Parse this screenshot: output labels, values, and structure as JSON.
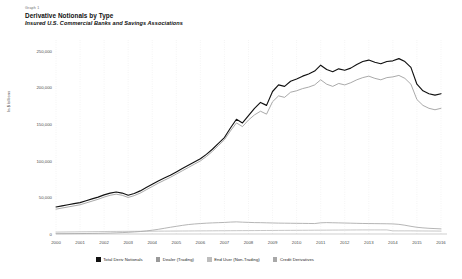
{
  "header": {
    "graph_number": "Graph 1",
    "title": "Derivative Notionals by Type",
    "subtitle": "Insured U.S. Commercial Banks and Savings Associations"
  },
  "legend": [
    {
      "label": "Total Deriv Notionals",
      "color": "#111111"
    },
    {
      "label": "Dealer (Trading)",
      "color": "#9a9a9a"
    },
    {
      "label": "End User (Non-Trading)",
      "color": "#bdbdbd"
    },
    {
      "label": "Credit Derivatives",
      "color": "#a8a8a8"
    }
  ],
  "chart_data": {
    "type": "line",
    "title": "Derivative Notionals by Type",
    "subtitle": "Insured U.S. Commercial Banks and Savings Associations",
    "xlabel": "",
    "ylabel": "In $ billions",
    "ylim": [
      0,
      260000
    ],
    "yticks": [
      0,
      50000,
      100000,
      150000,
      200000,
      250000
    ],
    "ytick_labels": [
      "0",
      "50,000",
      "100,000",
      "150,000",
      "200,000",
      "250,000"
    ],
    "xlim": [
      2000,
      2016.25
    ],
    "xticks": [
      2000,
      2001,
      2002,
      2003,
      2004,
      2005,
      2006,
      2007,
      2008,
      2009,
      2010,
      2011,
      2012,
      2013,
      2014,
      2015,
      2016
    ],
    "xtick_labels": [
      "2000",
      "2001",
      "2002",
      "2003",
      "2004",
      "2005",
      "2006",
      "2007",
      "2008",
      "2009",
      "2010",
      "2011",
      "2012",
      "2013",
      "2014",
      "2015",
      "2016"
    ],
    "grid": "vertical-dotted",
    "legend_position": "bottom",
    "x": [
      2000.0,
      2000.25,
      2000.5,
      2000.75,
      2001.0,
      2001.25,
      2001.5,
      2001.75,
      2002.0,
      2002.25,
      2002.5,
      2002.75,
      2003.0,
      2003.25,
      2003.5,
      2003.75,
      2004.0,
      2004.25,
      2004.5,
      2004.75,
      2005.0,
      2005.25,
      2005.5,
      2005.75,
      2006.0,
      2006.25,
      2006.5,
      2006.75,
      2007.0,
      2007.25,
      2007.5,
      2007.75,
      2008.0,
      2008.25,
      2008.5,
      2008.75,
      2009.0,
      2009.25,
      2009.5,
      2009.75,
      2010.0,
      2010.25,
      2010.5,
      2010.75,
      2011.0,
      2011.25,
      2011.5,
      2011.75,
      2012.0,
      2012.25,
      2012.5,
      2012.75,
      2013.0,
      2013.25,
      2013.5,
      2013.75,
      2014.0,
      2014.25,
      2014.5,
      2014.75,
      2015.0,
      2015.25,
      2015.5,
      2015.75,
      2016.0
    ],
    "series": [
      {
        "name": "Total Deriv Notionals",
        "color": "#111111",
        "values": [
          37000,
          38500,
          40000,
          41500,
          43000,
          45500,
          48000,
          50500,
          53500,
          56000,
          57500,
          56000,
          53000,
          55500,
          59000,
          63500,
          68000,
          72500,
          76500,
          80500,
          85000,
          89500,
          94000,
          98500,
          103000,
          109000,
          116000,
          124000,
          132000,
          145000,
          157000,
          152000,
          162000,
          172000,
          180000,
          176000,
          195000,
          204000,
          202000,
          209000,
          212000,
          216000,
          219000,
          223000,
          231000,
          225000,
          222000,
          226000,
          224000,
          227000,
          232000,
          236000,
          238000,
          235000,
          233000,
          236000,
          237000,
          240000,
          236000,
          228000,
          205000,
          196000,
          192000,
          190000,
          192000
        ]
      },
      {
        "name": "Dealer (Trading)",
        "color": "#9a9a9a",
        "values": [
          34000,
          35500,
          37000,
          38500,
          40000,
          42500,
          45000,
          47500,
          50500,
          53000,
          54500,
          53000,
          50000,
          52500,
          56000,
          60500,
          65000,
          69500,
          73500,
          77500,
          82000,
          86500,
          91000,
          95500,
          100000,
          106000,
          113000,
          121000,
          129000,
          141000,
          152000,
          147000,
          156000,
          163000,
          168000,
          164000,
          181000,
          189000,
          187000,
          194000,
          196000,
          199000,
          201000,
          204000,
          211000,
          205000,
          202000,
          206000,
          204000,
          207000,
          211000,
          214000,
          216000,
          213000,
          211000,
          214000,
          215000,
          217000,
          213000,
          205000,
          184000,
          176000,
          172000,
          170000,
          172000
        ]
      },
      {
        "name": "Credit Derivatives",
        "color": "#a8a8a8",
        "values": [
          400,
          450,
          500,
          560,
          620,
          700,
          800,
          900,
          1100,
          1300,
          1600,
          1900,
          2300,
          2800,
          3400,
          4200,
          5200,
          6400,
          7800,
          9200,
          10500,
          11800,
          12900,
          13700,
          14300,
          14800,
          15200,
          15500,
          15800,
          16300,
          16600,
          16200,
          15900,
          15600,
          15500,
          15300,
          15100,
          14900,
          14800,
          14700,
          14600,
          14500,
          14400,
          14300,
          15300,
          15600,
          15400,
          15200,
          15000,
          14800,
          14600,
          14400,
          14300,
          14200,
          14100,
          14000,
          13800,
          13200,
          12000,
          10500,
          9200,
          8400,
          7800,
          7400,
          7000
        ]
      },
      {
        "name": "End User (Non-Trading)",
        "color": "#bdbdbd",
        "values": [
          2600,
          2700,
          2800,
          2900,
          3000,
          3100,
          3200,
          3300,
          3400,
          3500,
          3550,
          3600,
          3650,
          3700,
          3750,
          3800,
          3850,
          3900,
          3950,
          4000,
          4050,
          4100,
          4150,
          4200,
          4250,
          4300,
          4350,
          4400,
          4450,
          4500,
          4550,
          4600,
          4650,
          4700,
          4750,
          4800,
          4850,
          4900,
          4950,
          5000,
          5050,
          5100,
          5150,
          5200,
          5250,
          5300,
          5350,
          5400,
          5450,
          5500,
          5550,
          5600,
          5600,
          5600,
          5600,
          5600,
          4300,
          4300,
          4300,
          4300,
          4200,
          4150,
          4100,
          4050,
          4000
        ]
      }
    ]
  }
}
